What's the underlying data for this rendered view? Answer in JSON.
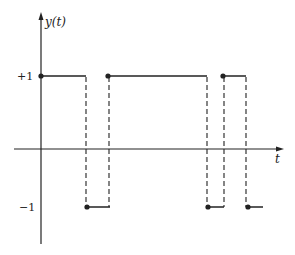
{
  "diagram": {
    "y_axis_label": "y(t)",
    "x_axis_label": "t",
    "level_high_label": "+1",
    "level_low_label": "−1",
    "line_color": "#222222",
    "background": "#ffffff",
    "waveform": {
      "type": "random binary (telegraph) signal",
      "levels": [
        1,
        -1
      ],
      "segments": [
        {
          "level": 1,
          "x_start": 41,
          "x_end": 86,
          "start_dot": true
        },
        {
          "level": -1,
          "x_start": 86,
          "x_end": 110,
          "start_dot": true
        },
        {
          "level": 1,
          "x_start": 108,
          "x_end": 207,
          "start_dot": true
        },
        {
          "level": -1,
          "x_start": 207,
          "x_end": 224,
          "start_dot": true
        },
        {
          "level": 1,
          "x_start": 223,
          "x_end": 246,
          "start_dot": true
        },
        {
          "level": -1,
          "x_start": 247,
          "x_end": 263,
          "start_dot": true
        }
      ],
      "transitions_dashed_x": [
        86,
        109,
        207,
        224,
        246
      ]
    }
  }
}
